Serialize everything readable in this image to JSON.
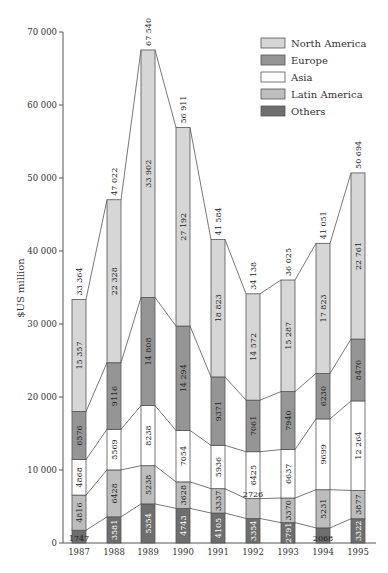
{
  "chart_data": {
    "type": "bar",
    "stacked": true,
    "title": "",
    "xlabel": "",
    "ylabel": "$US million",
    "ylim": [
      0,
      70000
    ],
    "yticks": [
      0,
      10000,
      20000,
      30000,
      40000,
      50000,
      60000,
      70000
    ],
    "ytick_labels": [
      "0",
      "10 000",
      "20 000",
      "30 000",
      "40 000",
      "50 000",
      "60 000",
      "70 000"
    ],
    "categories": [
      "1987",
      "1988",
      "1989",
      "1990",
      "1991",
      "1992",
      "1993",
      "1994",
      "1995"
    ],
    "series": [
      {
        "name": "Others",
        "color": "#6e6e6e",
        "values": [
          1747,
          3581,
          5354,
          4743,
          4105,
          3354,
          2791,
          2068,
          3322
        ],
        "labels": [
          "1747",
          "3581",
          "5354",
          "4743",
          "4105",
          "3354",
          "2791",
          "2068",
          "3322"
        ]
      },
      {
        "name": "Latin America",
        "color": "#bdbdbd",
        "values": [
          4816,
          6428,
          5238,
          3628,
          3337,
          2726,
          3370,
          5231,
          3877
        ],
        "labels": [
          "4816",
          "6428",
          "5238",
          "3628",
          "3337",
          "2726",
          "3370",
          "5231",
          "3877"
        ]
      },
      {
        "name": "Asia",
        "color": "#ffffff",
        "values": [
          4868,
          5569,
          8238,
          7054,
          5936,
          6425,
          6637,
          9699,
          12264
        ],
        "labels": [
          "4868",
          "5569",
          "8238",
          "7054",
          "5936",
          "6425",
          "6637",
          "9699",
          "12 264"
        ]
      },
      {
        "name": "Europe",
        "color": "#959595",
        "values": [
          6576,
          9116,
          14808,
          14294,
          9371,
          7061,
          7940,
          6230,
          8470
        ],
        "labels": [
          "6576",
          "9116",
          "14 808",
          "14 294",
          "9371",
          "7061",
          "7940",
          "6230",
          "8470"
        ]
      },
      {
        "name": "North America",
        "color": "#d6d6d6",
        "values": [
          15357,
          22328,
          33902,
          27192,
          18823,
          14572,
          15287,
          17823,
          22761
        ],
        "labels": [
          "15 357",
          "22 328",
          "33 902",
          "27 192",
          "18 823",
          "14 572",
          "15 287",
          "17 823",
          "22 761"
        ]
      }
    ],
    "totals": [
      33364,
      47022,
      67540,
      56911,
      41584,
      34138,
      36025,
      41051,
      50694
    ],
    "total_labels": [
      "33 364",
      "47 022",
      "67 540",
      "56 911",
      "41 584",
      "34 138",
      "36 025",
      "41 051",
      "50 694"
    ],
    "legend": {
      "position": "top-right",
      "entries": [
        "North America",
        "Europe",
        "Asia",
        "Latin America",
        "Others"
      ]
    },
    "grid": false
  }
}
